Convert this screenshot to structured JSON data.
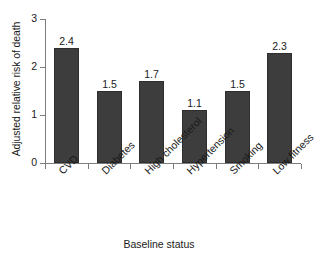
{
  "chart_data": {
    "type": "bar",
    "title": "",
    "subtitle": "",
    "xlabel": "Baseline status",
    "ylabel": "Adjusted relative risk of death",
    "categories": [
      "CVD",
      "Diabetes",
      "High cholesterol",
      "Hypertension",
      "Smoking",
      "Low fitness"
    ],
    "values": [
      2.4,
      1.5,
      1.7,
      1.1,
      1.5,
      2.3
    ],
    "value_labels": [
      "2.4",
      "1.5",
      "1.7",
      "1.1",
      "1.5",
      "2.3"
    ],
    "ylim": [
      0,
      3
    ],
    "yticks": [
      0,
      1,
      2,
      3
    ],
    "ytick_labels": [
      "0",
      "1",
      "2",
      "3"
    ],
    "grid": false,
    "legend": "none",
    "bar_color": "#3d3d3d",
    "bar_edge_color": "#2e2e2e",
    "axis_color": "#7d7d7d",
    "background": "#ffffff",
    "text_color": "#1a1a1a",
    "xtick_label_rotation": -45
  }
}
